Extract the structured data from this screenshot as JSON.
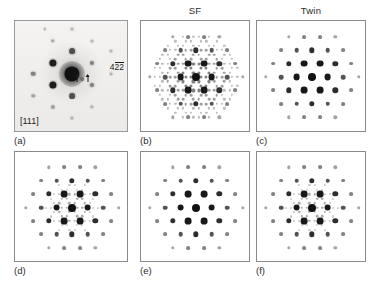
{
  "figure": {
    "background_color": "#ffffff",
    "spot_color": "#111111",
    "frame_color": "#8a8a8a"
  },
  "column_headers": [
    {
      "name": "col-header-1",
      "label": ""
    },
    {
      "name": "col-header-sf",
      "label": "SF"
    },
    {
      "name": "col-header-twin",
      "label": "Twin"
    }
  ],
  "panels": [
    {
      "id": "a",
      "caption": "(a)",
      "kind": "experimental",
      "zone_axis_label": "[111]",
      "reflection_label": {
        "text": "422",
        "overbar_digits": [
          2,
          3
        ],
        "display": "42̄2̄"
      },
      "arrow_count": 2,
      "description": "Experimental selected-area electron diffraction pattern, inverted contrast"
    },
    {
      "id": "b",
      "caption": "(b)",
      "kind": "simulated",
      "extra_reflections": "stacking-fault",
      "description": "Simulated pattern with strong 1/3 extra reflections across full field"
    },
    {
      "id": "c",
      "caption": "(c)",
      "kind": "simulated",
      "extra_reflections": "none",
      "description": "Simulated twin-related clean hexagonal pattern"
    },
    {
      "id": "d",
      "caption": "(d)",
      "kind": "simulated",
      "extra_reflections": "weak-central",
      "description": "Simulated pattern with faint extra reflections near the central region"
    },
    {
      "id": "e",
      "caption": "(e)",
      "kind": "simulated",
      "extra_reflections": "none",
      "description": "Simulated clean hexagonal matrix pattern"
    },
    {
      "id": "f",
      "caption": "(f)",
      "kind": "simulated",
      "extra_reflections": "weak-central",
      "description": "Simulated pattern with faint extra reflections near the central region"
    }
  ],
  "chart_data": {
    "type": "scatter",
    "xlabel": "",
    "ylabel": "",
    "grid": false,
    "legend": "none",
    "layout": {
      "rows": 2,
      "cols": 3,
      "panel_order": [
        "a",
        "b",
        "c",
        "d",
        "e",
        "f"
      ]
    },
    "lattice": {
      "description": "Hexagonal reciprocal lattice in 2D panel-relative units (center = 0,0; u = along +x step, v = 60-degree step)",
      "basis_u": [
        1.0,
        0.0
      ],
      "basis_v": [
        0.5,
        0.866
      ],
      "step_px": 15.5
    },
    "intensity_scale": {
      "central": 1.0,
      "strong": 0.8,
      "medium": 0.52,
      "weak": 0.3,
      "faint": 0.16,
      "very_faint": 0.09
    },
    "panels": [
      {
        "id": "a",
        "type": "experimental-image",
        "center": [
          0.5,
          0.47
        ],
        "spots": [
          {
            "x": 0.5,
            "y": 0.47,
            "r": 7.6,
            "i": "central",
            "halo": true
          },
          {
            "x": 0.33,
            "y": 0.372,
            "r": 3.6,
            "i": "strong"
          },
          {
            "x": 0.33,
            "y": 0.57,
            "r": 3.6,
            "i": "strong"
          },
          {
            "x": 0.5,
            "y": 0.272,
            "r": 2.9,
            "i": "medium"
          },
          {
            "x": 0.5,
            "y": 0.668,
            "r": 2.9,
            "i": "medium"
          },
          {
            "x": 0.672,
            "y": 0.372,
            "r": 2.1,
            "i": "weak"
          },
          {
            "x": 0.672,
            "y": 0.57,
            "r": 2.1,
            "i": "weak"
          },
          {
            "x": 0.16,
            "y": 0.47,
            "r": 2.3,
            "i": "weak"
          },
          {
            "x": 0.16,
            "y": 0.668,
            "r": 1.8,
            "i": "faint"
          },
          {
            "x": 0.33,
            "y": 0.175,
            "r": 1.8,
            "i": "faint"
          },
          {
            "x": 0.5,
            "y": 0.075,
            "r": 1.5,
            "i": "very_faint"
          },
          {
            "x": 0.672,
            "y": 0.175,
            "r": 1.6,
            "i": "very_faint"
          },
          {
            "x": 0.84,
            "y": 0.272,
            "r": 1.5,
            "i": "very_faint"
          },
          {
            "x": 0.84,
            "y": 0.47,
            "r": 1.5,
            "i": "very_faint"
          },
          {
            "x": 0.33,
            "y": 0.768,
            "r": 2.0,
            "i": "faint"
          },
          {
            "x": 0.5,
            "y": 0.868,
            "r": 1.6,
            "i": "very_faint"
          },
          {
            "x": 0.672,
            "y": 0.768,
            "r": 1.7,
            "i": "very_faint"
          },
          {
            "x": 0.59,
            "y": 0.52,
            "r": 1.7,
            "i": "faint"
          },
          {
            "x": 0.262,
            "y": 0.072,
            "r": 1.3,
            "i": "very_faint"
          }
        ]
      },
      {
        "id": "b",
        "type": "simulated",
        "pattern": "sf-full",
        "note": "Hexagonal matrix spots plus strong 1/3-position extra reflections on all rows"
      },
      {
        "id": "c",
        "type": "simulated",
        "pattern": "clean",
        "note": "Matrix spots only"
      },
      {
        "id": "d",
        "type": "simulated",
        "pattern": "sf-central",
        "note": "Matrix spots plus faint central extra reflections"
      },
      {
        "id": "e",
        "type": "simulated",
        "pattern": "clean",
        "note": "Matrix spots only"
      },
      {
        "id": "f",
        "type": "simulated",
        "pattern": "sf-central",
        "note": "Matrix spots plus faint central extra reflections"
      }
    ]
  }
}
